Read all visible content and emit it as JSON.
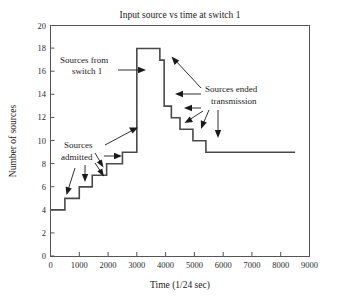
{
  "chart_data": {
    "type": "line",
    "title": "Input source vs time at switch 1",
    "xlabel": "Time (1/24 sec)",
    "ylabel": "Number of sources",
    "xlim": [
      0,
      9000
    ],
    "ylim": [
      0,
      20
    ],
    "grid": false,
    "legend": null,
    "xticks": [
      0,
      1000,
      2000,
      3000,
      4000,
      5000,
      6000,
      7000,
      8000,
      9000
    ],
    "xtick_labels": [
      "0",
      "1000",
      "2000",
      "3000",
      "4000",
      "5000",
      "6000",
      "7000",
      "8000",
      "9000"
    ],
    "yticks": [
      0,
      2,
      4,
      6,
      8,
      10,
      12,
      14,
      16,
      18,
      20
    ],
    "ytick_labels": [
      "0",
      "2",
      "4",
      "6",
      "8",
      "10",
      "12",
      "14",
      "16",
      "18",
      "20"
    ],
    "series": [
      {
        "name": "Number of sources",
        "step": "post",
        "x": [
          0,
          500,
          1000,
          1450,
          1950,
          2500,
          3000,
          3000,
          3800,
          3950,
          4200,
          4500,
          4950,
          5400,
          8500
        ],
        "y": [
          4,
          5,
          6,
          7,
          8,
          9,
          9,
          18,
          17,
          13,
          12,
          11,
          10,
          9,
          9
        ],
        "points": [
          {
            "x": 0,
            "y": 4
          },
          {
            "x": 500,
            "y": 5
          },
          {
            "x": 1000,
            "y": 6
          },
          {
            "x": 1450,
            "y": 7
          },
          {
            "x": 1950,
            "y": 8
          },
          {
            "x": 2500,
            "y": 9
          },
          {
            "x": 3000,
            "y": 18
          },
          {
            "x": 3800,
            "y": 17
          },
          {
            "x": 3950,
            "y": 13
          },
          {
            "x": 4200,
            "y": 12
          },
          {
            "x": 4500,
            "y": 11
          },
          {
            "x": 4950,
            "y": 10
          },
          {
            "x": 5400,
            "y": 9
          },
          {
            "x": 8500,
            "y": 9
          }
        ]
      }
    ],
    "annotations": [
      {
        "id": "sources-from-switch-1",
        "text_line1": "Sources from",
        "text_line2": "switch 1",
        "points_to": {
          "x": 3000,
          "y": 15
        }
      },
      {
        "id": "sources-admitted",
        "text_line1": "Sources",
        "text_line2": "admitted",
        "points_to": {
          "x": 2500,
          "y": 9
        }
      },
      {
        "id": "sources-ended-transmission",
        "text_line1": "Sources ended",
        "text_line2": "transmission",
        "points_to": {
          "x": 4000,
          "y": 13
        }
      }
    ]
  },
  "colors": {
    "line": "#4a4a4a",
    "frame": "#555555",
    "text": "#1a1a1a",
    "background": "#ffffff"
  }
}
